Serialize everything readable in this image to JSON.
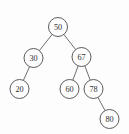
{
  "figure": {
    "background_color": "#fdfdfd",
    "stroke_color": "#4a4a4a",
    "text_color": "#2f2f2f"
  },
  "chart_data": {
    "type": "diagram",
    "diagram_kind": "binary-search-tree",
    "title": "",
    "xlabel": "",
    "ylabel": "",
    "nodes": [
      {
        "id": "n50",
        "label": "50",
        "cx": 58,
        "cy": 27,
        "r": 9.5,
        "level": 0
      },
      {
        "id": "n30",
        "label": "30",
        "cx": 33.5,
        "cy": 58,
        "r": 9.5,
        "level": 1
      },
      {
        "id": "n67",
        "label": "67",
        "cx": 81.5,
        "cy": 57,
        "r": 9.5,
        "level": 1
      },
      {
        "id": "n20",
        "label": "20",
        "cx": 19.5,
        "cy": 89,
        "r": 9.5,
        "level": 2
      },
      {
        "id": "n60",
        "label": "60",
        "cx": 69.5,
        "cy": 89,
        "r": 9.5,
        "level": 2
      },
      {
        "id": "n78",
        "label": "78",
        "cx": 93.5,
        "cy": 89,
        "r": 9.5,
        "level": 2
      },
      {
        "id": "n80",
        "label": "80",
        "cx": 109.5,
        "cy": 119,
        "r": 9.5,
        "level": 3
      }
    ],
    "edges": [
      {
        "from": "n50",
        "to": "n30",
        "side": "left"
      },
      {
        "from": "n50",
        "to": "n67",
        "side": "right"
      },
      {
        "from": "n30",
        "to": "n20",
        "side": "left"
      },
      {
        "from": "n67",
        "to": "n60",
        "side": "left"
      },
      {
        "from": "n67",
        "to": "n78",
        "side": "right"
      },
      {
        "from": "n78",
        "to": "n80",
        "side": "right"
      }
    ],
    "values": [
      50,
      30,
      67,
      20,
      60,
      78,
      80
    ],
    "root": "50",
    "node_count": 7
  }
}
